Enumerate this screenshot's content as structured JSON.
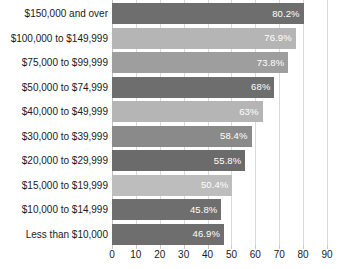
{
  "chart_data": {
    "type": "bar",
    "orientation": "horizontal",
    "title": "",
    "subtitle": "",
    "xlabel": "",
    "ylabel": "",
    "xlim": [
      0,
      90
    ],
    "xticks": [
      0,
      10,
      20,
      30,
      40,
      50,
      60,
      70,
      80,
      90
    ],
    "xtick_labels": [
      "0",
      "10",
      "20",
      "30",
      "40",
      "50",
      "60",
      "70",
      "80",
      "90"
    ],
    "grid": true,
    "grid_axis": "x",
    "legend": false,
    "legend_position": "none",
    "categories": [
      "$150,000 and over",
      "$100,000 to $149,999",
      "$75,000 to $99,999",
      "$50,000 to $74,999",
      "$40,000 to $49,999",
      "$30,000 to $39,999",
      "$20,000 to $29,999",
      "$15,000 to $19,999",
      "$10,000 to $14,999",
      "Less than $10,000"
    ],
    "values": [
      80.2,
      76.9,
      73.8,
      68,
      63,
      58.4,
      55.8,
      50.4,
      45.8,
      46.9
    ],
    "data_labels": [
      "80.2%",
      "76.9%",
      "73.8%",
      "68%",
      "63%",
      "58.4%",
      "55.8%",
      "50.4%",
      "45.8%",
      "46.9%"
    ],
    "bar_colors": [
      "#6e6e6e",
      "#b5b5b5",
      "#9e9e9e",
      "#6e6e6e",
      "#b5b5b5",
      "#8a8a8a",
      "#6b6b6b",
      "#bdbdbd",
      "#6e6e6e",
      "#6e6e6e"
    ],
    "data_label_color": "#ffffff"
  },
  "style": {
    "background": "#ffffff",
    "gridline_color": "#d9d9d9",
    "axis_color": "#c2c2c2",
    "text_color": "#1a1a1a"
  }
}
